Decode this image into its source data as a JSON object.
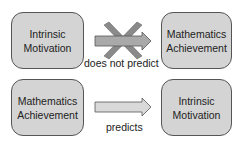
{
  "diagram": {
    "rows": [
      {
        "source": {
          "line1": "Intrinsic",
          "line2": "Motivation"
        },
        "target": {
          "line1": "Mathematics",
          "line2": "Achievement"
        },
        "relation": "does not predict",
        "crossed_out": true
      },
      {
        "source": {
          "line1": "Mathematics",
          "line2": "Achievement"
        },
        "target": {
          "line1": "Intrinsic",
          "line2": "Motivation"
        },
        "relation": "predicts",
        "crossed_out": false
      }
    ],
    "colors": {
      "box_fill": "#d4d4d4",
      "box_border": "#555555",
      "arrow_fill_top": "#a9a9a9",
      "arrow_fill_bottom": "#d9d9d9",
      "cross_fill": "#8a8a8a",
      "text": "#222222"
    }
  }
}
